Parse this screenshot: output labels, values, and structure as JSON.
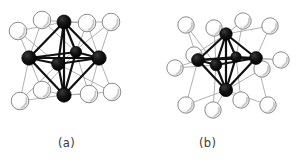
{
  "figure": {
    "type": "chemical-structure-diagram",
    "background_color": "#ffffff",
    "panels": [
      {
        "id": "a",
        "caption": "(a)",
        "caption_x": 58,
        "caption_y": 136,
        "cluster_type": "M6X8 face-capped octahedral cluster",
        "metal_atom_color": "#111111",
        "ligand_fill_color": "#fbfbfb",
        "ligand_stroke_color": "#8c8c8c",
        "metal_bond_color": "#111111",
        "ligand_bond_color": "#a8a8a8",
        "metal_atoms": [
          {
            "name": "metal-top",
            "x": 64,
            "y": 22,
            "r": 7.0,
            "shade": false
          },
          {
            "name": "metal-left",
            "x": 29,
            "y": 58,
            "r": 7.2,
            "shade": false
          },
          {
            "name": "metal-right",
            "x": 99,
            "y": 58,
            "r": 7.2,
            "shade": false
          },
          {
            "name": "metal-bottom",
            "x": 64,
            "y": 95,
            "r": 7.2,
            "shade": false
          },
          {
            "name": "metal-rear-interior",
            "x": 76,
            "y": 52,
            "r": 5.6,
            "shade": false
          },
          {
            "name": "metal-front-interior",
            "x": 58,
            "y": 64,
            "r": 6.4,
            "shade": false
          }
        ],
        "ligand_atoms": [
          {
            "name": "ligand-top-far-left",
            "x": 18,
            "y": 31,
            "r": 8.8
          },
          {
            "name": "ligand-top-inner-left",
            "x": 42,
            "y": 20,
            "r": 8.8
          },
          {
            "name": "ligand-top-inner-right",
            "x": 87,
            "y": 23,
            "r": 8.8
          },
          {
            "name": "ligand-top-far-right",
            "x": 111,
            "y": 22,
            "r": 8.8
          },
          {
            "name": "ligand-bot-far-left",
            "x": 20,
            "y": 101,
            "r": 8.8
          },
          {
            "name": "ligand-bot-inner-left",
            "x": 42,
            "y": 90,
            "r": 8.8
          },
          {
            "name": "ligand-bot-inner-right",
            "x": 89,
            "y": 94,
            "r": 8.8
          },
          {
            "name": "ligand-bot-far-right",
            "x": 112,
            "y": 92,
            "r": 8.8
          }
        ],
        "metal_bonds": [
          [
            0,
            1
          ],
          [
            0,
            2
          ],
          [
            0,
            3
          ],
          [
            1,
            2
          ],
          [
            1,
            3
          ],
          [
            2,
            3
          ],
          [
            0,
            4
          ],
          [
            1,
            4
          ],
          [
            2,
            4
          ],
          [
            3,
            4
          ],
          [
            0,
            5
          ],
          [
            1,
            5
          ],
          [
            2,
            5
          ],
          [
            3,
            5
          ]
        ],
        "ligand_bonds": [
          [
            0,
            0
          ],
          [
            0,
            1
          ],
          [
            0,
            5
          ],
          [
            1,
            0
          ],
          [
            1,
            1
          ],
          [
            1,
            4
          ],
          [
            2,
            0
          ],
          [
            2,
            2
          ],
          [
            2,
            4
          ],
          [
            3,
            0
          ],
          [
            3,
            2
          ],
          [
            3,
            5
          ],
          [
            4,
            1
          ],
          [
            4,
            3
          ],
          [
            4,
            5
          ],
          [
            5,
            1
          ],
          [
            5,
            3
          ],
          [
            5,
            4
          ],
          [
            6,
            2
          ],
          [
            6,
            3
          ],
          [
            6,
            4
          ],
          [
            7,
            2
          ],
          [
            7,
            3
          ],
          [
            7,
            5
          ]
        ]
      },
      {
        "id": "b",
        "caption": "(b)",
        "caption_x": 199,
        "caption_y": 136,
        "cluster_type": "M6X12 edge-bridged octahedral cluster",
        "metal_atom_color": "#111111",
        "ligand_fill_color": "#fbfbfb",
        "ligand_stroke_color": "#8c8c8c",
        "metal_bond_color": "#111111",
        "ligand_bond_color": "#a8a8a8",
        "metal_atoms": [
          {
            "name": "metal-top",
            "x": 226,
            "y": 34,
            "r": 6.2
          },
          {
            "name": "metal-left",
            "x": 198,
            "y": 60,
            "r": 6.4
          },
          {
            "name": "metal-right",
            "x": 256,
            "y": 58,
            "r": 6.4
          },
          {
            "name": "metal-bottom",
            "x": 226,
            "y": 90,
            "r": 6.6
          },
          {
            "name": "metal-rear-interior",
            "x": 236,
            "y": 57,
            "r": 5.2
          },
          {
            "name": "metal-front-interior",
            "x": 216,
            "y": 65,
            "r": 5.8
          }
        ],
        "ligand_atoms": [
          {
            "name": "ligand-nw-outer",
            "x": 186,
            "y": 25,
            "r": 8.2
          },
          {
            "name": "ligand-n-left",
            "x": 214,
            "y": 28,
            "r": 8.2
          },
          {
            "name": "ligand-n-right",
            "x": 243,
            "y": 21,
            "r": 8.2
          },
          {
            "name": "ligand-ne-outer",
            "x": 270,
            "y": 26,
            "r": 8.2
          },
          {
            "name": "ligand-w-outer",
            "x": 175,
            "y": 68,
            "r": 8.2
          },
          {
            "name": "ligand-w-inner",
            "x": 194,
            "y": 55,
            "r": 8.2
          },
          {
            "name": "ligand-e-inner",
            "x": 262,
            "y": 69,
            "r": 8.2
          },
          {
            "name": "ligand-e-outer",
            "x": 281,
            "y": 60,
            "r": 8.2
          },
          {
            "name": "ligand-sw-outer",
            "x": 186,
            "y": 105,
            "r": 8.2
          },
          {
            "name": "ligand-s-left",
            "x": 213,
            "y": 110,
            "r": 8.2
          },
          {
            "name": "ligand-s-right",
            "x": 241,
            "y": 100,
            "r": 8.2
          },
          {
            "name": "ligand-se-outer",
            "x": 268,
            "y": 105,
            "r": 8.2
          }
        ],
        "metal_bonds": [
          [
            0,
            1
          ],
          [
            0,
            2
          ],
          [
            0,
            3
          ],
          [
            1,
            2
          ],
          [
            1,
            3
          ],
          [
            2,
            3
          ],
          [
            0,
            4
          ],
          [
            1,
            4
          ],
          [
            2,
            4
          ],
          [
            3,
            4
          ],
          [
            0,
            5
          ],
          [
            1,
            5
          ],
          [
            2,
            5
          ],
          [
            3,
            5
          ]
        ],
        "ligand_bonds": [
          [
            0,
            1
          ],
          [
            0,
            5
          ],
          [
            1,
            0
          ],
          [
            1,
            5
          ],
          [
            2,
            0
          ],
          [
            2,
            4
          ],
          [
            3,
            0
          ],
          [
            3,
            2
          ],
          [
            4,
            1
          ],
          [
            4,
            5
          ],
          [
            5,
            1
          ],
          [
            5,
            0
          ],
          [
            6,
            2
          ],
          [
            6,
            3
          ],
          [
            7,
            2
          ],
          [
            7,
            4
          ],
          [
            8,
            1
          ],
          [
            8,
            3
          ],
          [
            9,
            3
          ],
          [
            9,
            5
          ],
          [
            10,
            3
          ],
          [
            10,
            4
          ],
          [
            11,
            2
          ],
          [
            11,
            3
          ]
        ]
      }
    ]
  }
}
